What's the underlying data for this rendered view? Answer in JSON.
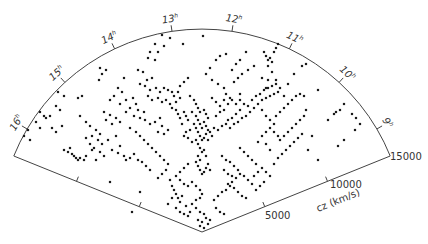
{
  "figure": {
    "type": "redshift-survey-wedge-diagram",
    "apex": [
      202,
      232
    ],
    "radius_px": 203,
    "angle_start_deg": -158,
    "angle_end_deg": -22,
    "line_color": "#444444",
    "point_color": "#1a1a1a",
    "ra_ticks": [
      {
        "label": "16",
        "sup": "h",
        "x": 38,
        "y": 112
      },
      {
        "label": "15",
        "sup": "h",
        "x": 77,
        "y": 72
      },
      {
        "label": "14",
        "sup": "h",
        "x": 123,
        "y": 44
      },
      {
        "label": "13",
        "sup": "h",
        "x": 173,
        "y": 28
      },
      {
        "label": "12",
        "sup": "h",
        "x": 227,
        "y": 28
      },
      {
        "label": "11",
        "sup": "h",
        "x": 278,
        "y": 38
      },
      {
        "label": "10",
        "sup": "h",
        "x": 325,
        "y": 66
      },
      {
        "label": "9",
        "sup": "h",
        "x": 364,
        "y": 106
      }
    ],
    "cz_axis": {
      "label": "cz (km/s)",
      "ticks": [
        {
          "label": "5000",
          "x": 265,
          "y": 219
        },
        {
          "label": "10000",
          "x": 330,
          "y": 188
        },
        {
          "label": "15000",
          "x": 390,
          "y": 160
        }
      ]
    }
  },
  "chart_data": {
    "type": "scatter",
    "title": "",
    "xlabel": "Right Ascension (h)",
    "ylabel": "cz (km/s)",
    "ra_tick_labels": [
      "9h",
      "10h",
      "11h",
      "12h",
      "13h",
      "14h",
      "15h",
      "16h"
    ],
    "radial_tick_labels": [
      "5000",
      "10000",
      "15000"
    ],
    "radial_range": [
      0,
      15000
    ],
    "grid": false,
    "legend": null,
    "points_px": [
      [
        162,
        35
      ],
      [
        170,
        38
      ],
      [
        155,
        44
      ],
      [
        164,
        46
      ],
      [
        150,
        52
      ],
      [
        158,
        52
      ],
      [
        148,
        58
      ],
      [
        155,
        60
      ],
      [
        183,
        44
      ],
      [
        203,
        36
      ],
      [
        138,
        70
      ],
      [
        143,
        72
      ],
      [
        152,
        78
      ],
      [
        147,
        80
      ],
      [
        100,
        68
      ],
      [
        106,
        70
      ],
      [
        102,
        74
      ],
      [
        99,
        80
      ],
      [
        124,
        78
      ],
      [
        140,
        84
      ],
      [
        145,
        86
      ],
      [
        150,
        90
      ],
      [
        156,
        88
      ],
      [
        160,
        92
      ],
      [
        164,
        88
      ],
      [
        168,
        90
      ],
      [
        172,
        92
      ],
      [
        174,
        96
      ],
      [
        178,
        92
      ],
      [
        148,
        96
      ],
      [
        152,
        100
      ],
      [
        158,
        98
      ],
      [
        162,
        102
      ],
      [
        166,
        100
      ],
      [
        170,
        104
      ],
      [
        176,
        102
      ],
      [
        180,
        98
      ],
      [
        126,
        100
      ],
      [
        133,
        98
      ],
      [
        136,
        104
      ],
      [
        130,
        108
      ],
      [
        138,
        110
      ],
      [
        134,
        116
      ],
      [
        140,
        118
      ],
      [
        144,
        112
      ],
      [
        126,
        112
      ],
      [
        104,
        112
      ],
      [
        110,
        115
      ],
      [
        116,
        118
      ],
      [
        120,
        122
      ],
      [
        112,
        124
      ],
      [
        106,
        120
      ],
      [
        78,
        98
      ],
      [
        82,
        96
      ],
      [
        58,
        92
      ],
      [
        64,
        96
      ],
      [
        80,
        116
      ],
      [
        86,
        122
      ],
      [
        90,
        126
      ],
      [
        96,
        130
      ],
      [
        100,
        134
      ],
      [
        92,
        136
      ],
      [
        98,
        140
      ],
      [
        102,
        144
      ],
      [
        108,
        140
      ],
      [
        116,
        136
      ],
      [
        86,
        138
      ],
      [
        90,
        144
      ],
      [
        94,
        148
      ],
      [
        100,
        152
      ],
      [
        104,
        156
      ],
      [
        112,
        150
      ],
      [
        120,
        146
      ],
      [
        40,
        112
      ],
      [
        44,
        116
      ],
      [
        46,
        118
      ],
      [
        50,
        116
      ],
      [
        36,
        122
      ],
      [
        40,
        128
      ],
      [
        52,
        128
      ],
      [
        56,
        132
      ],
      [
        62,
        126
      ],
      [
        64,
        150
      ],
      [
        68,
        152
      ],
      [
        72,
        154
      ],
      [
        74,
        156
      ],
      [
        76,
        158
      ],
      [
        78,
        160
      ],
      [
        80,
        158
      ],
      [
        84,
        160
      ],
      [
        86,
        156
      ],
      [
        70,
        148
      ],
      [
        92,
        150
      ],
      [
        96,
        160
      ],
      [
        118,
        153
      ],
      [
        124,
        156
      ],
      [
        126,
        160
      ],
      [
        130,
        158
      ],
      [
        134,
        154
      ],
      [
        138,
        160
      ],
      [
        145,
        120
      ],
      [
        150,
        124
      ],
      [
        155,
        122
      ],
      [
        160,
        118
      ],
      [
        162,
        126
      ],
      [
        158,
        132
      ],
      [
        164,
        134
      ],
      [
        168,
        130
      ],
      [
        172,
        108
      ],
      [
        176,
        110
      ],
      [
        178,
        114
      ],
      [
        180,
        118
      ],
      [
        184,
        112
      ],
      [
        186,
        116
      ],
      [
        188,
        120
      ],
      [
        182,
        124
      ],
      [
        190,
        96
      ],
      [
        194,
        100
      ],
      [
        196,
        104
      ],
      [
        198,
        108
      ],
      [
        200,
        112
      ],
      [
        204,
        110
      ],
      [
        206,
        114
      ],
      [
        208,
        118
      ],
      [
        192,
        112
      ],
      [
        196,
        116
      ],
      [
        198,
        120
      ],
      [
        200,
        124
      ],
      [
        202,
        128
      ],
      [
        204,
        122
      ],
      [
        206,
        126
      ],
      [
        208,
        130
      ],
      [
        194,
        124
      ],
      [
        196,
        128
      ],
      [
        198,
        132
      ],
      [
        200,
        136
      ],
      [
        202,
        140
      ],
      [
        204,
        138
      ],
      [
        206,
        134
      ],
      [
        208,
        140
      ],
      [
        196,
        140
      ],
      [
        198,
        144
      ],
      [
        200,
        148
      ],
      [
        202,
        152
      ],
      [
        204,
        150
      ],
      [
        206,
        156
      ],
      [
        198,
        156
      ],
      [
        200,
        160
      ],
      [
        190,
        130
      ],
      [
        186,
        132
      ],
      [
        184,
        136
      ],
      [
        188,
        138
      ],
      [
        192,
        142
      ],
      [
        210,
        132
      ],
      [
        214,
        128
      ],
      [
        212,
        136
      ],
      [
        218,
        130
      ],
      [
        222,
        126
      ],
      [
        226,
        124
      ],
      [
        230,
        128
      ],
      [
        234,
        124
      ],
      [
        238,
        122
      ],
      [
        242,
        118
      ],
      [
        246,
        116
      ],
      [
        250,
        112
      ],
      [
        254,
        108
      ],
      [
        258,
        104
      ],
      [
        262,
        100
      ],
      [
        266,
        98
      ],
      [
        270,
        96
      ],
      [
        274,
        94
      ],
      [
        278,
        92
      ],
      [
        252,
        100
      ],
      [
        256,
        96
      ],
      [
        260,
        94
      ],
      [
        264,
        90
      ],
      [
        268,
        88
      ],
      [
        272,
        86
      ],
      [
        276,
        84
      ],
      [
        268,
        80
      ],
      [
        244,
        104
      ],
      [
        248,
        106
      ],
      [
        240,
        110
      ],
      [
        236,
        114
      ],
      [
        232,
        118
      ],
      [
        228,
        120
      ],
      [
        216,
        116
      ],
      [
        220,
        112
      ],
      [
        224,
        100
      ],
      [
        230,
        98
      ],
      [
        226,
        94
      ],
      [
        240,
        94
      ],
      [
        262,
        110
      ],
      [
        266,
        116
      ],
      [
        270,
        120
      ],
      [
        274,
        124
      ],
      [
        196,
        162
      ],
      [
        198,
        166
      ],
      [
        200,
        170
      ],
      [
        202,
        174
      ],
      [
        204,
        172
      ],
      [
        206,
        168
      ],
      [
        208,
        164
      ],
      [
        210,
        170
      ],
      [
        188,
        164
      ],
      [
        184,
        168
      ],
      [
        180,
        172
      ],
      [
        176,
        176
      ],
      [
        180,
        180
      ],
      [
        184,
        184
      ],
      [
        188,
        186
      ],
      [
        192,
        182
      ],
      [
        196,
        186
      ],
      [
        200,
        190
      ],
      [
        202,
        194
      ],
      [
        200,
        198
      ],
      [
        196,
        200
      ],
      [
        192,
        204
      ],
      [
        196,
        208
      ],
      [
        200,
        212
      ],
      [
        204,
        214
      ],
      [
        206,
        218
      ],
      [
        202,
        222
      ],
      [
        198,
        220
      ],
      [
        200,
        226
      ],
      [
        204,
        228
      ],
      [
        208,
        224
      ],
      [
        210,
        220
      ],
      [
        214,
        200
      ],
      [
        218,
        196
      ],
      [
        222,
        192
      ],
      [
        226,
        190
      ],
      [
        230,
        186
      ],
      [
        216,
        208
      ],
      [
        220,
        212
      ],
      [
        224,
        214
      ],
      [
        170,
        180
      ],
      [
        172,
        186
      ],
      [
        174,
        190
      ],
      [
        176,
        194
      ],
      [
        178,
        198
      ],
      [
        180,
        202
      ],
      [
        172,
        198
      ],
      [
        168,
        204
      ],
      [
        176,
        208
      ],
      [
        180,
        212
      ],
      [
        184,
        214
      ],
      [
        188,
        216
      ],
      [
        190,
        212
      ],
      [
        186,
        206
      ],
      [
        182,
        196
      ],
      [
        222,
        156
      ],
      [
        226,
        160
      ],
      [
        230,
        162
      ],
      [
        234,
        166
      ],
      [
        238,
        170
      ],
      [
        240,
        174
      ],
      [
        236,
        178
      ],
      [
        232,
        182
      ],
      [
        224,
        170
      ],
      [
        228,
        174
      ],
      [
        232,
        176
      ],
      [
        228,
        184
      ],
      [
        234,
        188
      ],
      [
        238,
        192
      ],
      [
        242,
        196
      ],
      [
        246,
        198
      ],
      [
        244,
        176
      ],
      [
        248,
        180
      ],
      [
        252,
        184
      ],
      [
        256,
        190
      ],
      [
        260,
        186
      ],
      [
        264,
        182
      ],
      [
        254,
        176
      ],
      [
        258,
        172
      ],
      [
        240,
        148
      ],
      [
        244,
        152
      ],
      [
        248,
        156
      ],
      [
        252,
        160
      ],
      [
        256,
        164
      ],
      [
        262,
        168
      ],
      [
        266,
        172
      ],
      [
        270,
        176
      ],
      [
        274,
        164
      ],
      [
        278,
        158
      ],
      [
        282,
        154
      ],
      [
        286,
        150
      ],
      [
        290,
        146
      ],
      [
        294,
        142
      ],
      [
        298,
        138
      ],
      [
        302,
        134
      ],
      [
        280,
        140
      ],
      [
        284,
        136
      ],
      [
        288,
        132
      ],
      [
        292,
        128
      ],
      [
        296,
        124
      ],
      [
        300,
        120
      ],
      [
        304,
        116
      ],
      [
        306,
        110
      ],
      [
        258,
        142
      ],
      [
        262,
        136
      ],
      [
        266,
        132
      ],
      [
        270,
        128
      ],
      [
        274,
        132
      ],
      [
        278,
        136
      ],
      [
        266,
        144
      ],
      [
        270,
        150
      ],
      [
        276,
        116
      ],
      [
        280,
        112
      ],
      [
        284,
        108
      ],
      [
        288,
        104
      ],
      [
        292,
        100
      ],
      [
        296,
        96
      ],
      [
        300,
        94
      ],
      [
        304,
        96
      ],
      [
        264,
        52
      ],
      [
        266,
        56
      ],
      [
        268,
        60
      ],
      [
        270,
        58
      ],
      [
        272,
        62
      ],
      [
        268,
        66
      ],
      [
        274,
        52
      ],
      [
        276,
        48
      ],
      [
        278,
        44
      ],
      [
        246,
        52
      ],
      [
        262,
        78
      ],
      [
        266,
        88
      ],
      [
        272,
        72
      ],
      [
        276,
        80
      ],
      [
        280,
        88
      ],
      [
        284,
        96
      ],
      [
        288,
        84
      ],
      [
        294,
        74
      ],
      [
        302,
        66
      ],
      [
        306,
        64
      ],
      [
        318,
        90
      ],
      [
        328,
        120
      ],
      [
        334,
        114
      ],
      [
        336,
        112
      ],
      [
        340,
        110
      ],
      [
        344,
        104
      ],
      [
        352,
        114
      ],
      [
        356,
        118
      ],
      [
        360,
        124
      ],
      [
        355,
        130
      ],
      [
        344,
        140
      ],
      [
        338,
        146
      ],
      [
        312,
        136
      ],
      [
        308,
        150
      ],
      [
        318,
        160
      ],
      [
        234,
        82
      ],
      [
        238,
        78
      ],
      [
        242,
        74
      ],
      [
        232,
        70
      ],
      [
        236,
        64
      ],
      [
        240,
        60
      ],
      [
        248,
        70
      ],
      [
        254,
        66
      ],
      [
        216,
        60
      ],
      [
        220,
        56
      ],
      [
        226,
        54
      ],
      [
        210,
        68
      ],
      [
        206,
        74
      ],
      [
        212,
        80
      ],
      [
        218,
        84
      ],
      [
        224,
        88
      ],
      [
        118,
        88
      ],
      [
        122,
        92
      ],
      [
        114,
        96
      ],
      [
        110,
        100
      ],
      [
        120,
        104
      ],
      [
        188,
        78
      ],
      [
        184,
        82
      ],
      [
        180,
        86
      ],
      [
        130,
        128
      ],
      [
        136,
        132
      ],
      [
        140,
        136
      ],
      [
        144,
        140
      ],
      [
        148,
        144
      ],
      [
        152,
        148
      ],
      [
        156,
        152
      ],
      [
        160,
        156
      ],
      [
        164,
        160
      ],
      [
        168,
        164
      ],
      [
        166,
        170
      ],
      [
        162,
        174
      ],
      [
        158,
        178
      ],
      [
        150,
        170
      ],
      [
        146,
        166
      ],
      [
        142,
        162
      ],
      [
        212,
        98
      ],
      [
        216,
        102
      ],
      [
        220,
        106
      ],
      [
        224,
        110
      ],
      [
        228,
        104
      ],
      [
        232,
        100
      ],
      [
        236,
        104
      ],
      [
        240,
        100
      ],
      [
        56,
        106
      ],
      [
        60,
        110
      ],
      [
        24,
        136
      ],
      [
        30,
        140
      ],
      [
        28,
        130
      ],
      [
        132,
        212
      ],
      [
        140,
        192
      ],
      [
        110,
        182
      ]
    ]
  }
}
